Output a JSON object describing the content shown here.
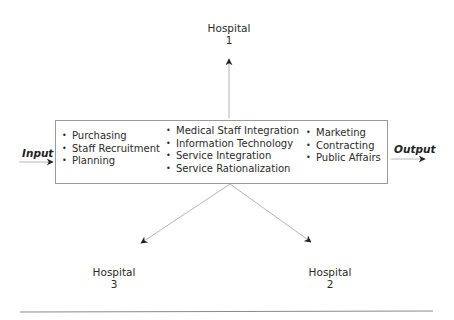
{
  "diagram": {
    "hospitals": [
      {
        "name": "Hospital",
        "number": "1"
      },
      {
        "name": "Hospital",
        "number": "2"
      },
      {
        "name": "Hospital",
        "number": "3"
      }
    ],
    "input_label": "Input",
    "output_label": "Output",
    "box": {
      "columns": [
        {
          "items": [
            "Purchasing",
            "Staff Recruitment",
            "Planning"
          ]
        },
        {
          "items": [
            "Medical Staff Integration",
            "Information Technology",
            "Service Integration",
            "Service Rationalization"
          ]
        },
        {
          "items": [
            "Marketing",
            "Contracting",
            "Public Affairs"
          ]
        }
      ]
    },
    "colors": {
      "line": "#b5b5b5",
      "arrowhead": "#222222",
      "box_border": "#9a9a9a",
      "rule": "#8a8a8a"
    }
  }
}
